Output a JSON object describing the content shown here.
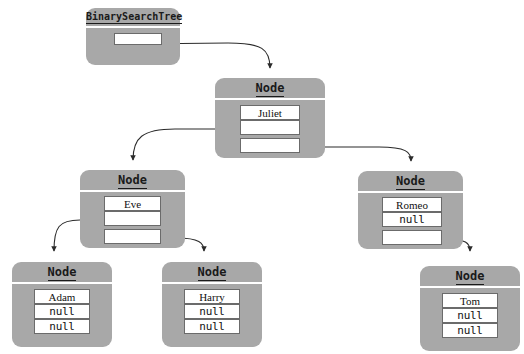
{
  "diagram": {
    "type": "object-reference-diagram",
    "title_font_style": "monospace-bold-underlined",
    "colors": {
      "box_fill": "#a8a8a8",
      "field_fill": "#ffffff",
      "field_border": "#6b6b6b",
      "text": "#111111",
      "edge": "#2b2b2b",
      "background": "#ffffff"
    }
  },
  "boxes": {
    "bst": {
      "title": "BinarySearchTree",
      "fields": [
        {
          "value": "",
          "kind": "reference"
        }
      ]
    },
    "root": {
      "title": "Node",
      "fields": [
        {
          "value": "Juliet",
          "kind": "name"
        },
        {
          "value": "",
          "kind": "reference"
        },
        {
          "value": "",
          "kind": "reference"
        }
      ]
    },
    "left": {
      "title": "Node",
      "fields": [
        {
          "value": "Eve",
          "kind": "name"
        },
        {
          "value": "",
          "kind": "reference"
        },
        {
          "value": "",
          "kind": "reference"
        }
      ]
    },
    "right": {
      "title": "Node",
      "fields": [
        {
          "value": "Romeo",
          "kind": "name"
        },
        {
          "value": "null",
          "kind": "null"
        },
        {
          "value": "",
          "kind": "reference"
        }
      ]
    },
    "adam": {
      "title": "Node",
      "fields": [
        {
          "value": "Adam",
          "kind": "name"
        },
        {
          "value": "null",
          "kind": "null"
        },
        {
          "value": "null",
          "kind": "null"
        }
      ]
    },
    "harry": {
      "title": "Node",
      "fields": [
        {
          "value": "Harry",
          "kind": "name"
        },
        {
          "value": "null",
          "kind": "null"
        },
        {
          "value": "null",
          "kind": "null"
        }
      ]
    },
    "tom": {
      "title": "Node",
      "fields": [
        {
          "value": "Tom",
          "kind": "name"
        },
        {
          "value": "null",
          "kind": "null"
        },
        {
          "value": "null",
          "kind": "null"
        }
      ]
    }
  },
  "edges": [
    {
      "from": "bst.field0",
      "to": "root"
    },
    {
      "from": "root.field1",
      "to": "left"
    },
    {
      "from": "root.field2",
      "to": "right"
    },
    {
      "from": "left.field1",
      "to": "adam"
    },
    {
      "from": "left.field2",
      "to": "harry"
    },
    {
      "from": "right.field2",
      "to": "tom"
    }
  ]
}
